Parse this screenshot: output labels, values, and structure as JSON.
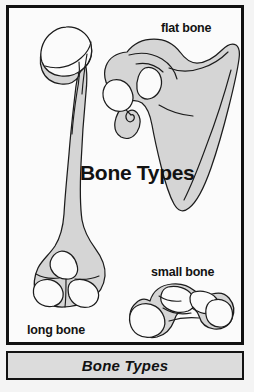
{
  "figure": {
    "title": "Bone Types",
    "caption": "Bone Types",
    "background_color": "#f4f4f4",
    "panel_border_color": "#101010",
    "caption_bar_color": "#dcdcdc",
    "bone_fill_color": "#d5d5d5",
    "bone_highlight_color": "#fbfbfb",
    "bone_outline_color": "#1c1c1c",
    "labels": [
      {
        "id": "flat-bone",
        "text": "flat bone"
      },
      {
        "id": "long-bone",
        "text": "long bone"
      },
      {
        "id": "small-bone",
        "text": "small bone"
      }
    ],
    "specimens": [
      {
        "id": "long-bone",
        "name": "humerus",
        "label": "long bone"
      },
      {
        "id": "flat-bone",
        "name": "scapula",
        "label": "flat bone"
      },
      {
        "id": "small-bone",
        "name": "carpal-tarsal",
        "label": "small bone"
      }
    ]
  }
}
